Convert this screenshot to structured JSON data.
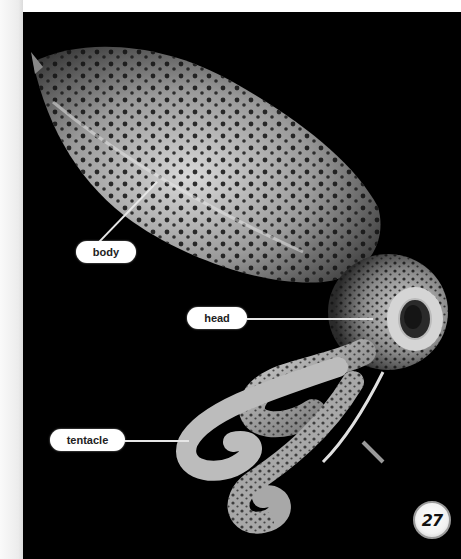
{
  "page": {
    "page_number": "27",
    "background_color": "#000000",
    "margin_color": "#f4f4f4"
  },
  "figure": {
    "labels": [
      {
        "id": "body",
        "text": "body"
      },
      {
        "id": "head",
        "text": "head"
      },
      {
        "id": "tentacle",
        "text": "tentacle"
      }
    ]
  },
  "icons": {
    "page_badge": "page-number-badge"
  }
}
